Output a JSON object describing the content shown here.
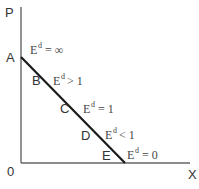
{
  "diagram": {
    "title": "",
    "axes": {
      "y_label": "P",
      "x_label": "X",
      "origin_label": "0"
    },
    "demand_curve": {
      "start": "A",
      "end": "E",
      "color": "#1a1a1a"
    },
    "points": [
      {
        "label": "A",
        "elasticity_base": "E",
        "elasticity_sup": "d",
        "elasticity_rel": "= ∞"
      },
      {
        "label": "B",
        "elasticity_base": "E",
        "elasticity_sup": "d",
        "elasticity_rel": "> 1"
      },
      {
        "label": "C",
        "elasticity_base": "E",
        "elasticity_sup": "d",
        "elasticity_rel": "= 1"
      },
      {
        "label": "D",
        "elasticity_base": "E",
        "elasticity_sup": "d",
        "elasticity_rel": "< 1"
      },
      {
        "label": "E",
        "elasticity_base": "E",
        "elasticity_sup": "d",
        "elasticity_rel": "= 0"
      }
    ],
    "colors": {
      "axis": "#666666",
      "curve": "#1a1a1a",
      "text": "#333333"
    }
  }
}
